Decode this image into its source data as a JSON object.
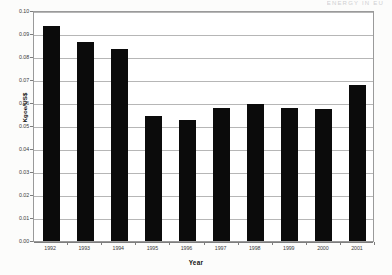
{
  "page": {
    "running_header": "ENERGY  IN  EU"
  },
  "chart_data": {
    "type": "bar",
    "title": "",
    "subtitle": "",
    "xlabel": "Year",
    "ylabel": "Kgoe/US$",
    "categories": [
      "1992",
      "1993",
      "1994",
      "1995",
      "1996",
      "1997",
      "1998",
      "1999",
      "2000",
      "2001"
    ],
    "values": [
      0.0935,
      0.0865,
      0.0835,
      0.0545,
      0.0525,
      0.058,
      0.0595,
      0.058,
      0.0575,
      0.068
    ],
    "series": [
      {
        "name": "Energy intensity",
        "values": [
          0.0935,
          0.0865,
          0.0835,
          0.0545,
          0.0525,
          0.058,
          0.0595,
          0.058,
          0.0575,
          0.068
        ]
      }
    ],
    "ylim": [
      0.0,
      0.1
    ],
    "ytick_step": 0.01,
    "ytick_labels": [
      "0.10",
      "0.09",
      "0.08",
      "0.07",
      "0.06",
      "0.05",
      "0.04",
      "0.03",
      "0.02",
      "0.01",
      "0.00"
    ],
    "ytick_values": [
      0.1,
      0.09,
      0.08,
      0.07,
      0.06,
      0.05,
      0.04,
      0.03,
      0.02,
      0.01,
      0.0
    ],
    "grid": true,
    "grid_axis": "y",
    "legend": false,
    "legend_position": "none",
    "bar_color": "#0b0b0b",
    "plot_background": "#ffffff",
    "grid_color": "#b6b6b6",
    "axis_color": "#7d7d7d"
  }
}
